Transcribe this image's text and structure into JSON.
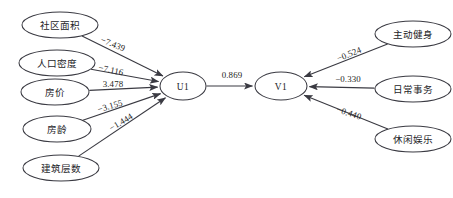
{
  "diagram": {
    "type": "path-diagram",
    "title": "",
    "background_color": "#ffffff",
    "line_color": "#3a3a42",
    "text_color": "#242428",
    "nodes": [
      {
        "id": "sqmj",
        "label": "社区面积",
        "cx": 60,
        "cy": 25,
        "rx": 38,
        "ry": 13,
        "kind": "observed",
        "side": "left"
      },
      {
        "id": "rkmd",
        "label": "人口密度",
        "cx": 57,
        "cy": 63,
        "rx": 38,
        "ry": 13,
        "kind": "observed",
        "side": "left"
      },
      {
        "id": "fj",
        "label": "房价",
        "cx": 55,
        "cy": 92,
        "rx": 34,
        "ry": 13,
        "kind": "observed",
        "side": "left"
      },
      {
        "id": "fl",
        "label": "房龄",
        "cx": 57,
        "cy": 129,
        "rx": 34,
        "ry": 13,
        "kind": "observed",
        "side": "left"
      },
      {
        "id": "jzcs",
        "label": "建筑层数",
        "cx": 61,
        "cy": 168,
        "rx": 38,
        "ry": 13,
        "kind": "observed",
        "side": "left"
      },
      {
        "id": "U1",
        "label": "U1",
        "cx": 183,
        "cy": 86,
        "rx": 23,
        "ry": 14,
        "kind": "latent",
        "side": "center"
      },
      {
        "id": "V1",
        "label": "V1",
        "cx": 281,
        "cy": 86,
        "rx": 26,
        "ry": 14,
        "kind": "latent",
        "side": "center"
      },
      {
        "id": "zdjs",
        "label": "主动健身",
        "cx": 413,
        "cy": 34,
        "rx": 38,
        "ry": 13,
        "kind": "observed",
        "side": "right"
      },
      {
        "id": "rcsw",
        "label": "日常事务",
        "cx": 413,
        "cy": 89,
        "rx": 38,
        "ry": 13,
        "kind": "observed",
        "side": "right"
      },
      {
        "id": "xxyl",
        "label": "休闲娱乐",
        "cx": 413,
        "cy": 139,
        "rx": 38,
        "ry": 13,
        "kind": "observed",
        "side": "right"
      }
    ],
    "edges": [
      {
        "id": "e1",
        "from": "sqmj",
        "to": "U1",
        "weight": "−7.439",
        "lx": 113,
        "ly": 44,
        "angle": 22
      },
      {
        "id": "e2",
        "from": "rkmd",
        "to": "U1",
        "weight": "−7.116",
        "lx": 111,
        "ly": 70,
        "angle": 12
      },
      {
        "id": "e3",
        "from": "fj",
        "to": "U1",
        "weight": "3.478",
        "lx": 113,
        "ly": 84,
        "angle": 0
      },
      {
        "id": "e4",
        "from": "fl",
        "to": "U1",
        "weight": "−3.155",
        "lx": 110,
        "ly": 106,
        "angle": -16
      },
      {
        "id": "e5",
        "from": "jzcs",
        "to": "U1",
        "weight": "−1.444",
        "lx": 121,
        "ly": 122,
        "angle": -31
      },
      {
        "id": "e6",
        "from": "U1",
        "to": "V1",
        "weight": "0.869",
        "lx": 232,
        "ly": 75,
        "angle": 0
      },
      {
        "id": "e7",
        "from": "zdjs",
        "to": "V1",
        "weight": "−0.524",
        "lx": 349,
        "ly": 54,
        "angle": -22
      },
      {
        "id": "e8",
        "from": "rcsw",
        "to": "V1",
        "weight": "−0.330",
        "lx": 348,
        "ly": 79,
        "angle": 0
      },
      {
        "id": "e9",
        "from": "xxyl",
        "to": "V1",
        "weight": "−0.440",
        "lx": 349,
        "ly": 113,
        "angle": 18
      }
    ]
  }
}
